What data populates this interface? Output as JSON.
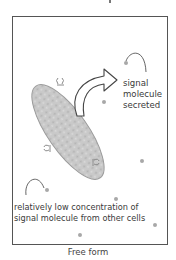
{
  "diagram": {
    "labels": {
      "secreted_line1": "signal",
      "secreted_line2": "molecule",
      "secreted_line3": "secreted",
      "low_conc_line1": "relatively low concentration of",
      "low_conc_line2": "signal molecule from other cells"
    },
    "caption": "Free form",
    "colors": {
      "frame": "#555555",
      "cell_fill": "#c8c8c8",
      "cell_stroke": "#9a9a9a",
      "arrow_stroke": "#444444",
      "dot": "#a8a8a8"
    }
  }
}
